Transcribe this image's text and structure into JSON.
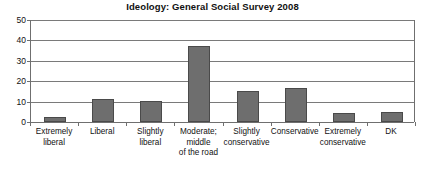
{
  "chart_data": {
    "type": "bar",
    "title": "Ideology: General Social Survey 2008",
    "xlabel": "",
    "ylabel": "",
    "ylim": [
      0,
      50
    ],
    "yticks": [
      0,
      10,
      20,
      30,
      40,
      50
    ],
    "grid": true,
    "legend": false,
    "bar_color": "#6e6e6e",
    "bar_edge_color": "#4a4a4a",
    "axis_color": "#6f6f6f",
    "categories": [
      "Extremely liberal",
      "Liberal",
      "Slightly liberal",
      "Moderate; middle of the road",
      "Slightly conservative",
      "Conservative",
      "Extremely conservative",
      "DK"
    ],
    "category_lines": [
      [
        "Extremely",
        "liberal"
      ],
      [
        "Liberal"
      ],
      [
        "Slightly",
        "liberal"
      ],
      [
        "Moderate;",
        "middle",
        "of the road"
      ],
      [
        "Slightly",
        "conservative"
      ],
      [
        "Conservative"
      ],
      [
        "Extremely",
        "conservative"
      ],
      [
        "DK"
      ]
    ],
    "values": [
      2.5,
      11.5,
      10.2,
      37.5,
      15.2,
      16.6,
      4.5,
      5.1
    ]
  }
}
